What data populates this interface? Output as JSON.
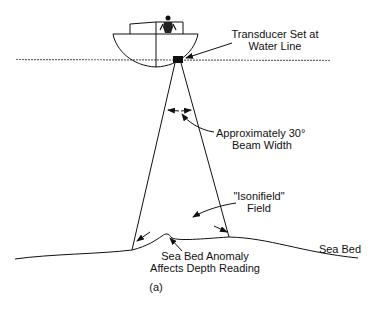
{
  "diagram": {
    "type": "echo-sounder-schematic",
    "caption": "(a)",
    "colors": {
      "ink": "#111111",
      "background": "#ffffff",
      "water_line": "#666666"
    },
    "labels": {
      "transducer_line1": "Transducer Set at",
      "transducer_line2": "Water Line",
      "beam_line1": "Approximately 30°",
      "beam_line2": "Beam Width",
      "isonified_line1": "\"Isonifield\"",
      "isonified_line2": "Field",
      "anomaly_line1": "Sea Bed Anomaly",
      "anomaly_line2": "Affects Depth Reading",
      "sea_bed": "Sea Bed"
    },
    "components": [
      "boat",
      "operator",
      "transducer",
      "water-line",
      "sonar-beam",
      "beam-width-arrows",
      "sea-bed",
      "sea-bed-anomaly"
    ]
  }
}
